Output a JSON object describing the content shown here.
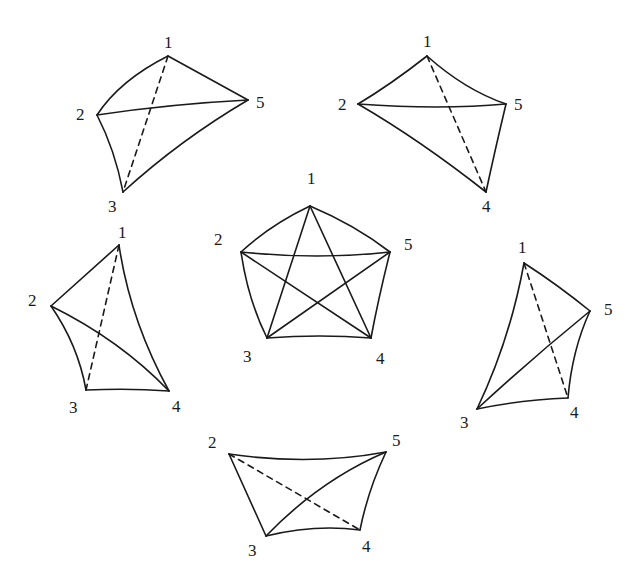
{
  "figures": [
    {
      "id": "top-left",
      "vertices": {
        "1": {
          "x": 168,
          "y": 56,
          "lx": 164,
          "ly": 48,
          "label": "1"
        },
        "2": {
          "x": 97,
          "y": 115,
          "lx": 76,
          "ly": 120,
          "label": "2"
        },
        "3": {
          "x": 123,
          "y": 192,
          "lx": 108,
          "ly": 212,
          "label": "3"
        },
        "5": {
          "x": 248,
          "y": 100,
          "lx": 256,
          "ly": 108,
          "label": "5"
        }
      },
      "edges": [
        {
          "d": "M168,56 Q120,80 97,115",
          "dashed": false
        },
        {
          "d": "M168,56 L248,100",
          "dashed": false
        },
        {
          "d": "M97,115 Q170,104 248,100",
          "dashed": false
        },
        {
          "d": "M97,115 Q115,150 123,192",
          "dashed": false
        },
        {
          "d": "M123,192 Q180,140 248,100",
          "dashed": false
        },
        {
          "d": "M168,56 L123,192",
          "dashed": true
        }
      ]
    },
    {
      "id": "top-right",
      "vertices": {
        "1": {
          "x": 427,
          "y": 56,
          "lx": 423,
          "ly": 47,
          "label": "1"
        },
        "2": {
          "x": 358,
          "y": 104,
          "lx": 338,
          "ly": 110,
          "label": "2"
        },
        "5": {
          "x": 506,
          "y": 104,
          "lx": 514,
          "ly": 110,
          "label": "5"
        },
        "4": {
          "x": 486,
          "y": 192,
          "lx": 482,
          "ly": 212,
          "label": "4"
        }
      },
      "edges": [
        {
          "d": "M427,56 Q390,85 358,104",
          "dashed": false
        },
        {
          "d": "M427,56 Q465,90 506,104",
          "dashed": false
        },
        {
          "d": "M358,104 Q440,110 506,104",
          "dashed": false
        },
        {
          "d": "M358,104 Q420,140 486,192",
          "dashed": false
        },
        {
          "d": "M506,104 Q495,150 486,192",
          "dashed": false
        },
        {
          "d": "M427,56 L486,192",
          "dashed": true
        }
      ]
    },
    {
      "id": "center",
      "vertices": {
        "1": {
          "x": 310,
          "y": 206,
          "lx": 307,
          "ly": 184,
          "label": "1"
        },
        "2": {
          "x": 241,
          "y": 252,
          "lx": 214,
          "ly": 245,
          "label": "2"
        },
        "5": {
          "x": 390,
          "y": 252,
          "lx": 404,
          "ly": 250,
          "label": "5"
        },
        "3": {
          "x": 267,
          "y": 338,
          "lx": 243,
          "ly": 362,
          "label": "3"
        },
        "4": {
          "x": 371,
          "y": 338,
          "lx": 376,
          "ly": 364,
          "label": "4"
        }
      },
      "edges": [
        {
          "d": "M310,206 Q270,225 241,252",
          "dashed": false
        },
        {
          "d": "M310,206 Q355,225 390,252",
          "dashed": false
        },
        {
          "d": "M241,252 Q318,260 390,252",
          "dashed": false
        },
        {
          "d": "M241,252 Q248,300 267,338",
          "dashed": false
        },
        {
          "d": "M390,252 Q378,300 371,338",
          "dashed": false
        },
        {
          "d": "M267,338 Q320,334 371,338",
          "dashed": false
        },
        {
          "d": "M310,206 L267,338",
          "dashed": false
        },
        {
          "d": "M310,206 L371,338",
          "dashed": false
        },
        {
          "d": "M241,252 L371,338",
          "dashed": false
        },
        {
          "d": "M390,252 L267,338",
          "dashed": false
        }
      ]
    },
    {
      "id": "left",
      "vertices": {
        "1": {
          "x": 119,
          "y": 245,
          "lx": 118,
          "ly": 238,
          "label": "1"
        },
        "2": {
          "x": 51,
          "y": 306,
          "lx": 28,
          "ly": 306,
          "label": "2"
        },
        "3": {
          "x": 86,
          "y": 390,
          "lx": 69,
          "ly": 413,
          "label": "3"
        },
        "4": {
          "x": 169,
          "y": 391,
          "lx": 172,
          "ly": 412,
          "label": "4"
        }
      },
      "edges": [
        {
          "d": "M119,245 L51,306",
          "dashed": false
        },
        {
          "d": "M119,245 Q130,320 169,391",
          "dashed": false
        },
        {
          "d": "M51,306 Q78,345 86,390",
          "dashed": false
        },
        {
          "d": "M51,306 Q120,340 169,391",
          "dashed": false
        },
        {
          "d": "M86,390 Q130,388 169,391",
          "dashed": false
        },
        {
          "d": "M119,245 L86,390",
          "dashed": true
        }
      ]
    },
    {
      "id": "right",
      "vertices": {
        "1": {
          "x": 524,
          "y": 263,
          "lx": 518,
          "ly": 253,
          "label": "1"
        },
        "5": {
          "x": 590,
          "y": 311,
          "lx": 604,
          "ly": 315,
          "label": "5"
        },
        "3": {
          "x": 477,
          "y": 409,
          "lx": 460,
          "ly": 428,
          "label": "3"
        },
        "4": {
          "x": 568,
          "y": 398,
          "lx": 570,
          "ly": 418,
          "label": "4"
        }
      },
      "edges": [
        {
          "d": "M524,263 Q510,340 477,409",
          "dashed": false
        },
        {
          "d": "M524,263 Q558,285 590,311",
          "dashed": false
        },
        {
          "d": "M477,409 Q530,360 590,311",
          "dashed": false
        },
        {
          "d": "M477,409 Q520,400 568,398",
          "dashed": false
        },
        {
          "d": "M590,311 Q572,350 568,398",
          "dashed": false
        },
        {
          "d": "M524,263 L568,398",
          "dashed": true
        }
      ]
    },
    {
      "id": "bottom",
      "vertices": {
        "2": {
          "x": 229,
          "y": 454,
          "lx": 208,
          "ly": 448,
          "label": "2"
        },
        "5": {
          "x": 386,
          "y": 452,
          "lx": 392,
          "ly": 446,
          "label": "5"
        },
        "3": {
          "x": 266,
          "y": 536,
          "lx": 248,
          "ly": 556,
          "label": "3"
        },
        "4": {
          "x": 360,
          "y": 530,
          "lx": 362,
          "ly": 552,
          "label": "4"
        }
      },
      "edges": [
        {
          "d": "M229,454 Q310,466 386,452",
          "dashed": false
        },
        {
          "d": "M229,454 L266,536",
          "dashed": false
        },
        {
          "d": "M266,536 Q320,480 386,452",
          "dashed": false
        },
        {
          "d": "M266,536 Q315,524 360,530",
          "dashed": false
        },
        {
          "d": "M386,452 Q368,490 360,530",
          "dashed": false
        },
        {
          "d": "M229,454 L360,530",
          "dashed": true
        }
      ]
    }
  ]
}
